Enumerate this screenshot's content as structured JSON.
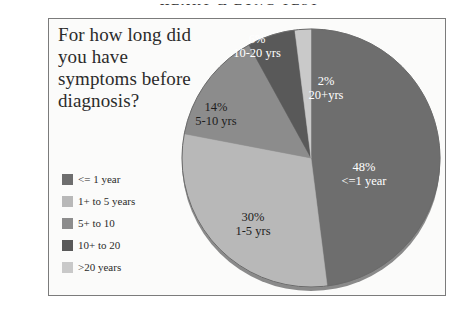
{
  "page": {
    "cut_off_header": "HEART & LUNG TEST"
  },
  "chart_title": "For how long did you have symptoms before diagnosis?",
  "legend": {
    "items": [
      {
        "label": "<= 1 year",
        "color": "#6e6e6e"
      },
      {
        "label": "1+ to 5 years",
        "color": "#b8b8b8"
      },
      {
        "label": "5+ to 10",
        "color": "#8c8c8c"
      },
      {
        "label": "10+ to 20",
        "color": "#595959"
      },
      {
        "label": ">20 years",
        "color": "#c9c9c9"
      }
    ]
  },
  "chart_data": {
    "type": "pie",
    "title": "For how long did you have symptoms before diagnosis?",
    "xlabel": "",
    "ylabel": "",
    "legend_position": "left",
    "categories": [
      "<= 1 year",
      "1+ to 5 years",
      "5+ to 10",
      "10+ to 20",
      ">20 years"
    ],
    "values": [
      48,
      30,
      14,
      6,
      2
    ],
    "unit": "%",
    "colors": [
      "#6e6e6e",
      "#b8b8b8",
      "#8c8c8c",
      "#595959",
      "#c9c9c9"
    ],
    "slice_labels": [
      {
        "percent": "48%",
        "name": "<=1 year",
        "text_color": "#ffffff"
      },
      {
        "percent": "30%",
        "name": "1-5 yrs",
        "text_color": "#1d1d1d"
      },
      {
        "percent": "14%",
        "name": "5-10 yrs",
        "text_color": "#1d1d1d"
      },
      {
        "percent": "6%",
        "name": "10-20 yrs",
        "text_color": "#ffffff"
      },
      {
        "percent": "2%",
        "name": "20+yrs",
        "text_color": "#ffffff"
      }
    ],
    "start_angle_deg": 0,
    "direction": "clockwise",
    "total": 100
  }
}
